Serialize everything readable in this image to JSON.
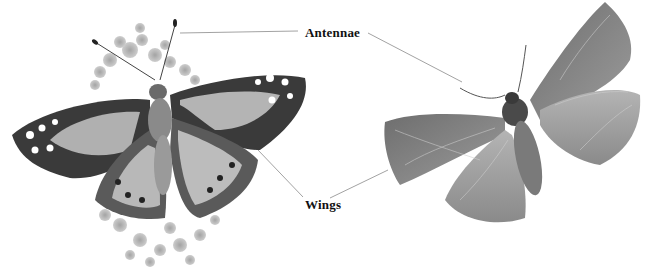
{
  "figure": {
    "title_partial": " ",
    "labels": {
      "antennae": "Antennae",
      "wings": "Wings"
    },
    "subjects": [
      {
        "name": "butterfly",
        "description": "Painted lady butterfly on flower cluster, top view"
      },
      {
        "name": "moth",
        "description": "Moth with spread wings, top view"
      }
    ],
    "colors": {
      "background": "#ffffff",
      "label_text": "#111111",
      "leader_line": "#8a8a8a"
    }
  }
}
